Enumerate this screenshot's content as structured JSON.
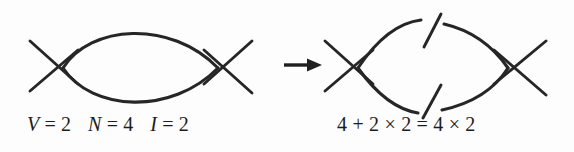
{
  "figure": {
    "background_color": "#fdfdfd",
    "ink_color": "#262626",
    "left_diagram": {
      "name": "one-loop bubble diagram",
      "vertices": 2,
      "external_legs": 4,
      "internal_lines": 2,
      "cut": false
    },
    "right_diagram": {
      "name": "cut one-loop bubble diagram",
      "vertices": 2,
      "external_legs": 4,
      "internal_lines": 2,
      "cut": true,
      "cut_marks": 2
    },
    "arrow": {
      "symbol": "right-arrow",
      "direction": "right"
    }
  },
  "captions": {
    "left": {
      "full_text": "V = 2   N = 4   I = 2",
      "terms": [
        {
          "symbol": "V",
          "relation": "=",
          "value": "2"
        },
        {
          "symbol": "N",
          "relation": "=",
          "value": "4"
        },
        {
          "symbol": "I",
          "relation": "=",
          "value": "2"
        }
      ]
    },
    "right": {
      "full_text": "4 + 2 × 2 = 4 × 2",
      "lhs": "4 + 2 × 2",
      "rhs": "4 × 2",
      "tokens": [
        "4",
        "+",
        "2",
        "×",
        "2",
        "=",
        "4",
        "×",
        "2"
      ]
    }
  }
}
